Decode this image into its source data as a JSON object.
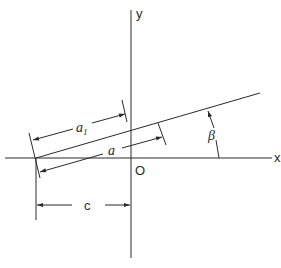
{
  "diagram": {
    "axes": {
      "x_label": "x",
      "y_label": "y",
      "origin_label": "O"
    },
    "dimensions": {
      "a1_label": "a",
      "a1_subscript": "1",
      "a_label": "a",
      "c_label": "c",
      "angle_label": "β"
    }
  }
}
